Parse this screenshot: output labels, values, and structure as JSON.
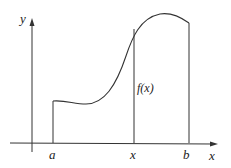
{
  "diagram": {
    "type": "function-area-under-curve",
    "axes": {
      "x_label": "x",
      "y_label": "y"
    },
    "ticks": [
      {
        "id": "a",
        "label": "a"
      },
      {
        "id": "x",
        "label": "x"
      },
      {
        "id": "b",
        "label": "b"
      }
    ],
    "curve_label": "f(x)",
    "colors": {
      "stroke": "#333333",
      "background": "#ffffff"
    }
  }
}
